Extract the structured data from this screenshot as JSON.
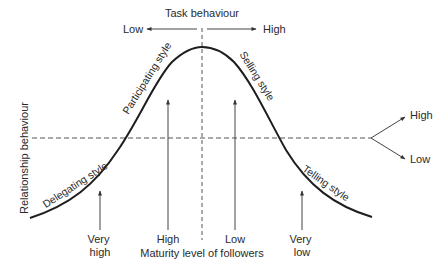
{
  "diagram": {
    "type": "situational-leadership-curve",
    "top_axis": {
      "title": "Task behaviour",
      "low_label": "Low",
      "high_label": "High"
    },
    "left_axis": {
      "title": "Relationship behaviour"
    },
    "right_branch": {
      "high_label": "High",
      "low_label": "Low"
    },
    "curve_styles": [
      {
        "label": "Delegating style",
        "angle": -33
      },
      {
        "label": "Participating style",
        "angle": -58
      },
      {
        "label": "Selling style",
        "angle": 58
      },
      {
        "label": "Telling style",
        "angle": 35
      }
    ],
    "maturity_markers": [
      {
        "line1": "Very",
        "line2": "high"
      },
      {
        "line1": "High",
        "line2": ""
      },
      {
        "line1": "Low",
        "line2": ""
      },
      {
        "line1": "Very",
        "line2": "low"
      }
    ],
    "bottom_axis": {
      "title": "Maturity level of followers"
    },
    "colors": {
      "line": "#1e1e1e",
      "arrow": "#444444",
      "dashed": "#555555",
      "text": "#2a2a2a"
    }
  }
}
